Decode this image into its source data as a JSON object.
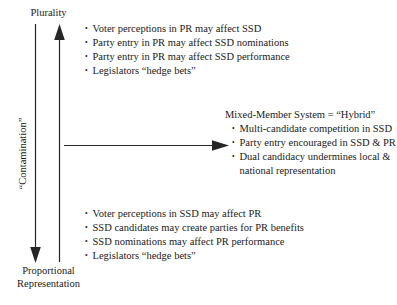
{
  "diagram": {
    "background_color": "#ffffff",
    "text_color": "#1a1a1a"
  },
  "axis": {
    "top_label": "Plurality",
    "bottom_label_line1": "Proportional",
    "bottom_label_line2": "Representation",
    "vertical_label": "“Contamination”",
    "up_arrow_name": "upward-arrow",
    "down_arrow_name": "downward-arrow",
    "horizontal_arrow_name": "rightward-arrow"
  },
  "top_effects": {
    "items": [
      "Voter perceptions in PR may affect SSD",
      "Party entry in PR may affect SSD nominations",
      "Party entry in PR may affect SSD performance",
      "Legislators “hedge bets”"
    ]
  },
  "bottom_effects": {
    "items": [
      "Voter perceptions in SSD may affect PR",
      "SSD candidates may create parties for PR benefits",
      "SSD nominations may affect PR performance",
      "Legislators “hedge bets”"
    ]
  },
  "hybrid_outcomes": {
    "heading": "Mixed-Member System = “Hybrid”",
    "items": [
      "Multi-candidate competition in SSD",
      "Party entry encouraged in SSD & PR",
      "Dual candidacy undermines local & national representation"
    ]
  }
}
